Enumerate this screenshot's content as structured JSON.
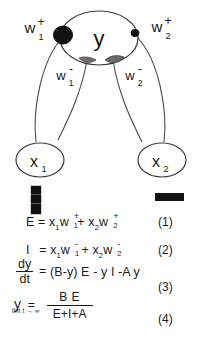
{
  "figure": {
    "type": "neural-network-shunting-diagram",
    "nodes": [
      {
        "id": "y",
        "label": "y",
        "sub": "",
        "role": "output-node"
      },
      {
        "id": "x1",
        "label": "x",
        "sub": "1",
        "role": "input-node"
      },
      {
        "id": "x2",
        "label": "x",
        "sub": "2",
        "role": "input-node"
      }
    ],
    "edge_labels": [
      {
        "id": "w1plus",
        "base": "w",
        "sup": "+",
        "sub": "1",
        "synapse": "excitatory"
      },
      {
        "id": "w2plus",
        "base": "w",
        "sup": "+",
        "sub": "2",
        "synapse": "excitatory"
      },
      {
        "id": "w1minus",
        "base": "w",
        "sup": "-",
        "sub": "1",
        "synapse": "inhibitory"
      },
      {
        "id": "w2minus",
        "base": "w",
        "sup": "-",
        "sub": "2",
        "synapse": "inhibitory"
      }
    ],
    "synapse_colors": {
      "excitatory": "#111111",
      "inhibitory": "#5e5e5e",
      "outline": "#4a4a4a"
    }
  },
  "bars": {
    "left_bar_name": "vertical-black-bar",
    "right_bar_name": "horizontal-black-bar"
  },
  "equations": [
    {
      "number": "(1)",
      "lhs": "E",
      "rhs": "x1w1+ + x2w2+",
      "parts": {
        "lhs": "E",
        "eq": "=",
        "t1_x": "x",
        "t1_xsub": "1",
        "t1_w": "w",
        "t1_wsup": "+",
        "t1_wsub": "1",
        "plus": "+",
        "t2_x": "x",
        "t2_xsub": "2",
        "t2_w": "w",
        "t2_wsup": "+",
        "t2_wsub": "2"
      }
    },
    {
      "number": "(2)",
      "lhs": "I",
      "rhs": "x1w1- + x2w2-",
      "parts": {
        "lhs": "I",
        "eq": "=",
        "t1_x": "x",
        "t1_xsub": "1",
        "t1_w": "w",
        "t1_wsup": "-",
        "t1_wsub": "1",
        "plus": "+",
        "t2_x": "x",
        "t2_xsub": "2",
        "t2_w": "w",
        "t2_wsup": "-",
        "t2_wsub": "2"
      }
    },
    {
      "number": "(3)",
      "lhs_num": "dy",
      "lhs_den": "dt",
      "eq": "=",
      "rhs": "(B-y) E - y I -A y"
    },
    {
      "number": "(4)",
      "lhs": "y",
      "eq": "=",
      "limit": "lim t → ∞",
      "num": "B E",
      "den": "E+I+A"
    }
  ]
}
